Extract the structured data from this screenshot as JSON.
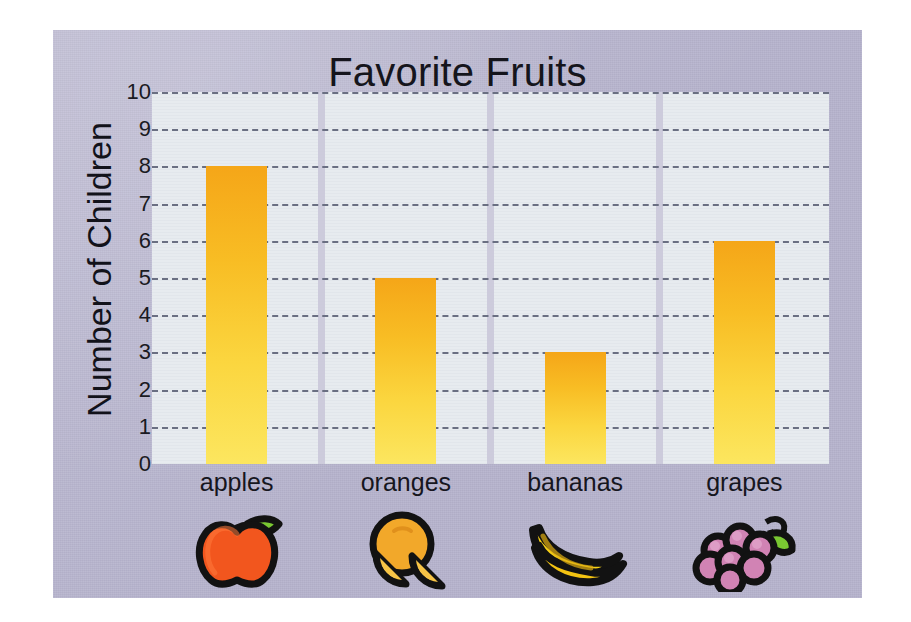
{
  "chart_data": {
    "type": "bar",
    "title": "Favorite Fruits",
    "xlabel": "",
    "ylabel": "Number of Children",
    "categories": [
      "apples",
      "oranges",
      "bananas",
      "grapes"
    ],
    "values": [
      8,
      5,
      3,
      6
    ],
    "ylim": [
      0,
      10
    ],
    "ytick_labels": [
      "0",
      "1",
      "2",
      "3",
      "4",
      "5",
      "6",
      "7",
      "8",
      "9",
      "10"
    ],
    "ytick_values": [
      0,
      1,
      2,
      3,
      4,
      5,
      6,
      7,
      8,
      9,
      10
    ],
    "grid": "horizontal-dashed",
    "legend": "none",
    "bar_icons": [
      "apple-icon",
      "orange-icon",
      "banana-icon",
      "grapes-icon"
    ]
  },
  "style": {
    "card_background": "#b6b3cd",
    "plot_background": "#e7ebef",
    "gridline_color": "#6a6f82",
    "band_separator_color": "#c8c6d8",
    "bar_gradient_top": "#f5a618",
    "bar_gradient_bottom": "#fce65f",
    "text_color": "#15151c",
    "apple_body": "#f2561e",
    "apple_leaf": "#6cc72c",
    "orange_body": "#f2a82a",
    "orange_slice": "#f7c446",
    "banana_body": "#f7d117",
    "grape_body": "#d183b4",
    "grape_leaf": "#7ac832",
    "outline": "#121212"
  }
}
